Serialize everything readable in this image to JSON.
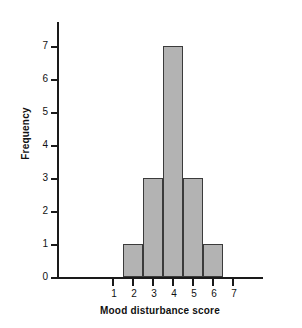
{
  "chart_data": {
    "type": "bar",
    "title": "",
    "xlabel": "Mood disturbance score",
    "ylabel": "Frequency",
    "categories": [
      "2",
      "3",
      "4",
      "5",
      "6"
    ],
    "values": [
      1,
      3,
      7,
      3,
      1
    ],
    "bins": [
      {
        "center": 2,
        "low": 1.5,
        "high": 2.5,
        "frequency": 1
      },
      {
        "center": 3,
        "low": 2.5,
        "high": 3.5,
        "frequency": 3
      },
      {
        "center": 4,
        "low": 3.5,
        "high": 4.5,
        "frequency": 7
      },
      {
        "center": 5,
        "low": 4.5,
        "high": 5.5,
        "frequency": 3
      },
      {
        "center": 6,
        "low": 5.5,
        "high": 6.5,
        "frequency": 1
      }
    ],
    "xlim": [
      0.5,
      7.5
    ],
    "ylim": [
      0,
      7
    ],
    "x_ticks": [
      "1",
      "2",
      "3",
      "4",
      "5",
      "6",
      "7"
    ],
    "y_ticks": [
      "0",
      "1",
      "2",
      "3",
      "4",
      "5",
      "6",
      "7"
    ],
    "grid": false,
    "legend": null,
    "bar_fill_color": "#b3b3b3",
    "bar_border_color": "#3b3b3b",
    "axis_color": "#1a1a1a",
    "background_color": "#ffffff"
  }
}
